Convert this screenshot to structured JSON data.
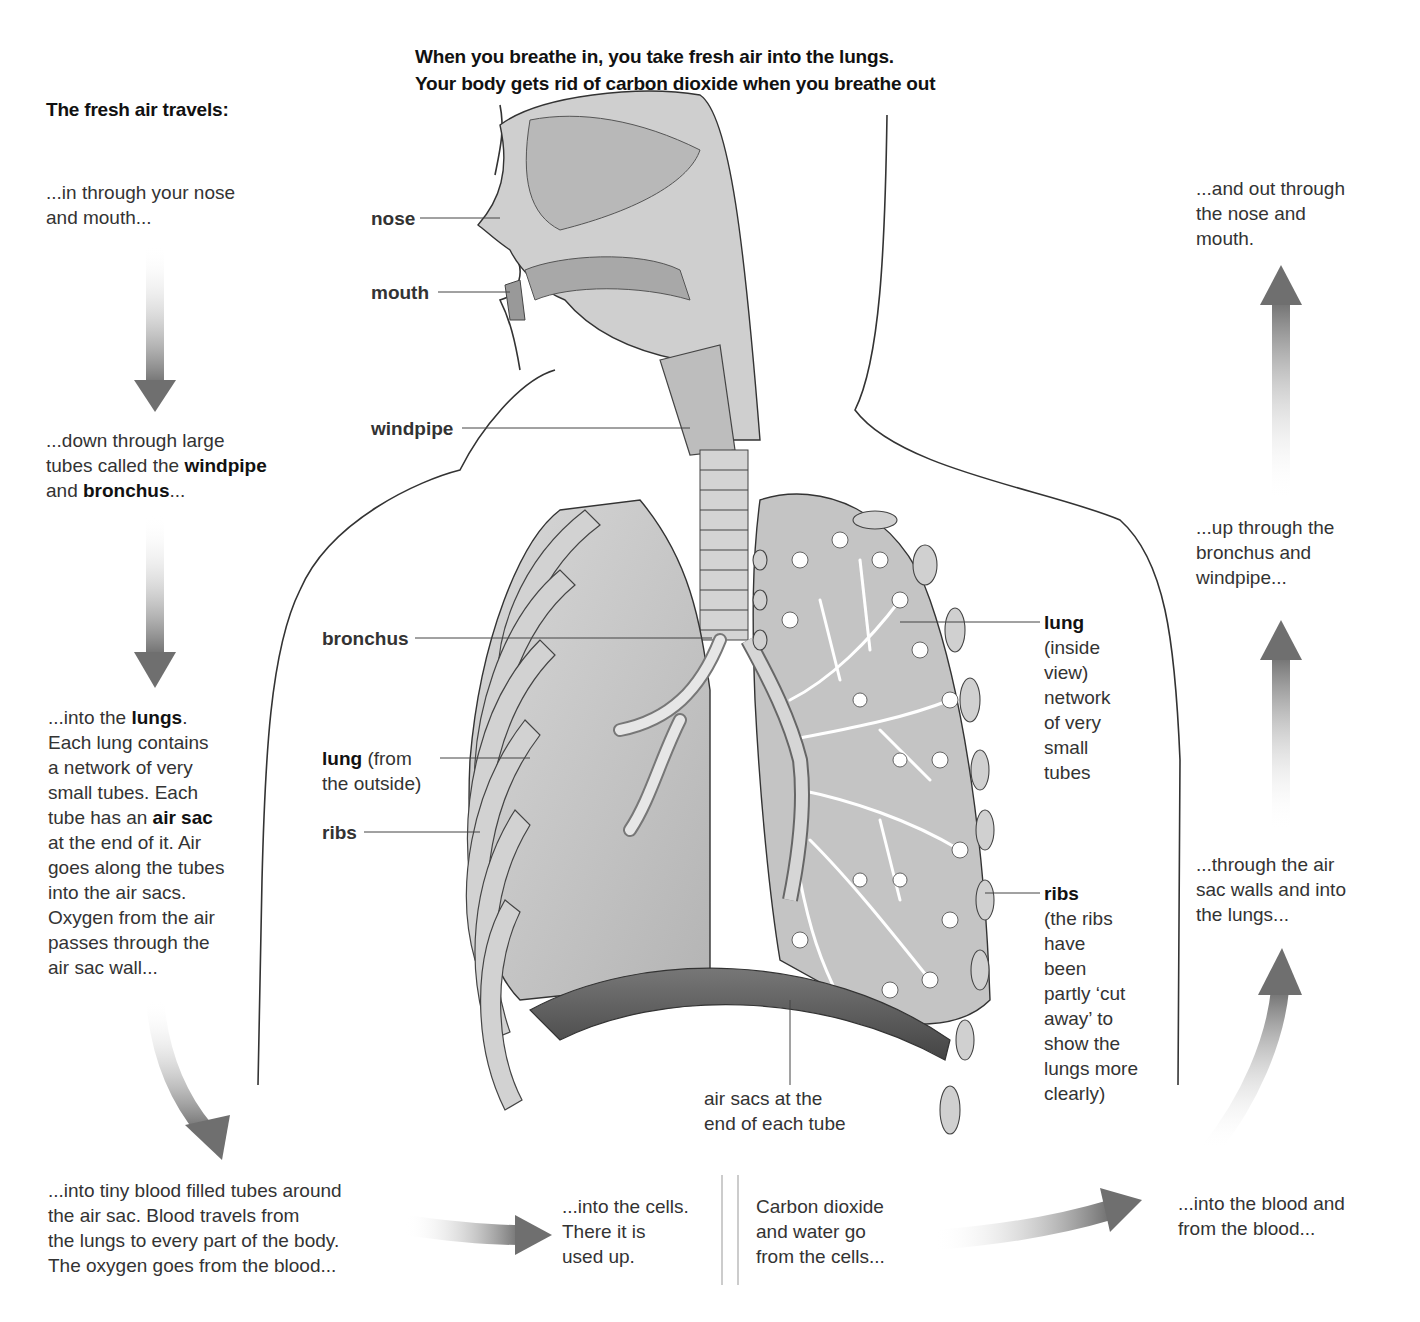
{
  "header": {
    "line1": "When you breathe in, you take fresh air into the lungs.",
    "line2": "Your body gets rid of carbon dioxide when you breathe out"
  },
  "left_column": {
    "title": "The fresh air travels:",
    "steps": [
      {
        "parts": [
          "...in through your nose",
          "and mouth..."
        ]
      },
      {
        "parts": [
          "...down through large",
          "tubes called the ",
          "windpipe",
          "and ",
          "bronchus",
          "..."
        ]
      },
      {
        "parts": [
          "...into the ",
          "lungs",
          ".",
          "Each lung contains",
          "a network of very",
          "small tubes. Each",
          "tube has an ",
          "air sac",
          "at the end of it. Air",
          "goes along the tubes",
          "into the air sacs.",
          "Oxygen from the air",
          "passes through the",
          "air sac wall..."
        ]
      }
    ]
  },
  "bottom_row": {
    "blood_text": [
      "...into tiny blood filled tubes around",
      "the air sac. Blood travels from",
      "the lungs to every part of the body.",
      "The oxygen goes from the blood..."
    ],
    "cells_text": [
      "...into the cells.",
      "There it is",
      "used up."
    ],
    "co2_text": [
      "Carbon dioxide",
      "and water go",
      "from the cells..."
    ],
    "into_blood_text": [
      "...into the blood and",
      "from the blood..."
    ]
  },
  "right_column": {
    "steps": [
      [
        "...through the air",
        "sac walls and into",
        "the lungs..."
      ],
      [
        "...up through the",
        "bronchus and",
        "windpipe..."
      ],
      [
        "...and out through",
        "the nose and",
        "mouth."
      ]
    ]
  },
  "labels": {
    "nose": "nose",
    "mouth": "mouth",
    "windpipe": "windpipe",
    "bronchus": "bronchus",
    "lung_outside_bold": "lung",
    "lung_outside_rest": " (from",
    "lung_outside_line2": "the outside)",
    "ribs_left": "ribs",
    "lung_inside_bold": "lung",
    "lung_inside_lines": [
      "(inside",
      "view)",
      "network",
      "of very",
      "small",
      "tubes"
    ],
    "ribs_right_bold": "ribs",
    "ribs_right_lines": [
      "(the ribs",
      "have",
      "been",
      "partly ‘cut",
      "away’ to",
      "show the",
      "lungs more",
      "clearly)"
    ],
    "air_sacs": [
      "air sacs at the",
      "end of each tube"
    ]
  },
  "colors": {
    "organ_fill": "#c9c9c9",
    "organ_dark": "#a8a8a8",
    "arrow": "#7a7a7a",
    "outline": "#333333"
  }
}
